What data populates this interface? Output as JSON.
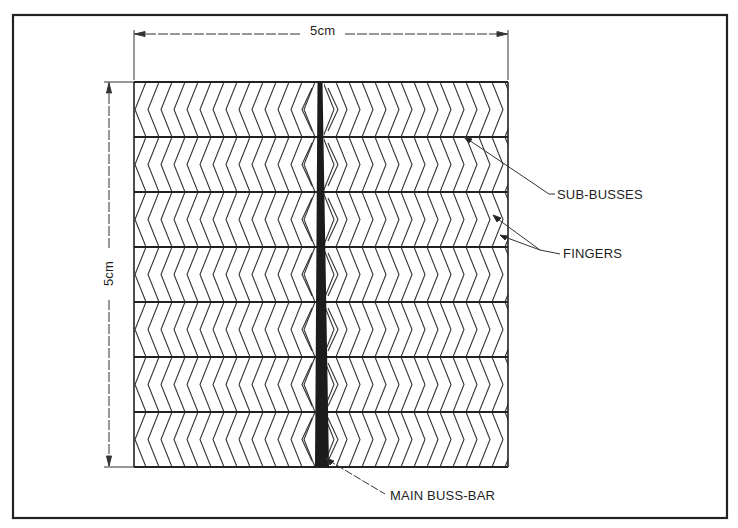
{
  "figure": {
    "dimensions": {
      "width_label": "5cm",
      "height_label": "5cm"
    },
    "labels": {
      "sub_busses": "SUB-BUSSES",
      "fingers": "FINGERS",
      "main_buss_bar": "MAIN BUSS-BAR"
    },
    "grid": {
      "rows": 7,
      "finger_pattern": "chevron",
      "left_half_direction": "left",
      "right_half_direction": "right"
    },
    "colors": {
      "line": "#2a2a2a",
      "background": "#ffffff"
    }
  }
}
